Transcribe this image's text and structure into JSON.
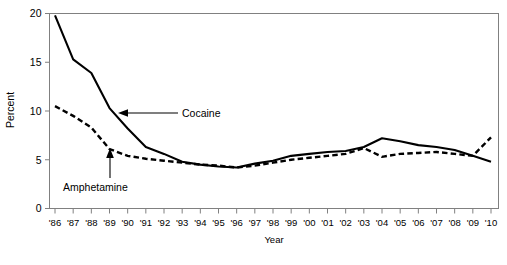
{
  "chart_data": {
    "type": "line",
    "title": "",
    "xlabel": "Year",
    "ylabel": "Percent",
    "xlim": [
      1986,
      2010
    ],
    "ylim": [
      0,
      20
    ],
    "yticks": [
      0,
      5,
      10,
      15,
      20
    ],
    "ytick_labels": [
      "0",
      "5",
      "10",
      "15",
      "20"
    ],
    "grid": false,
    "legend": "inline-annotations",
    "x": [
      1986,
      1987,
      1988,
      1989,
      1990,
      1991,
      1992,
      1993,
      1994,
      1995,
      1996,
      1997,
      1998,
      1999,
      2000,
      2001,
      2002,
      2003,
      2004,
      2005,
      2006,
      2007,
      2008,
      2009,
      2010
    ],
    "xtick_labels": [
      "'86",
      "'87",
      "'88",
      "'89",
      "'90",
      "'91",
      "'92",
      "'93",
      "'94",
      "'95",
      "'96",
      "'97",
      "'98",
      "'99",
      "'00",
      "'01",
      "'02",
      "'03",
      "'04",
      "'05",
      "'06",
      "'07",
      "'08",
      "'09",
      "'10"
    ],
    "series": [
      {
        "name": "Cocaine",
        "style": "solid",
        "values": [
          19.8,
          15.3,
          13.9,
          10.3,
          8.2,
          6.3,
          5.6,
          4.8,
          4.5,
          4.3,
          4.2,
          4.6,
          4.9,
          5.4,
          5.6,
          5.8,
          5.9,
          6.3,
          7.2,
          6.9,
          6.5,
          6.3,
          6.0,
          5.4,
          4.8
        ]
      },
      {
        "name": "Amphetamine",
        "style": "dashed",
        "values": [
          10.5,
          9.5,
          8.3,
          6.1,
          5.4,
          5.1,
          4.9,
          4.7,
          4.5,
          4.4,
          4.2,
          4.4,
          4.7,
          5.0,
          5.2,
          5.4,
          5.6,
          6.2,
          5.3,
          5.6,
          5.7,
          5.8,
          5.6,
          5.4,
          7.3
        ]
      }
    ],
    "annotations": [
      {
        "text": "Cocaine",
        "target_year": 1991,
        "target_value": 8.9
      },
      {
        "text": "Amphetamine",
        "target_year": 1989,
        "target_value": 6.1
      }
    ]
  }
}
